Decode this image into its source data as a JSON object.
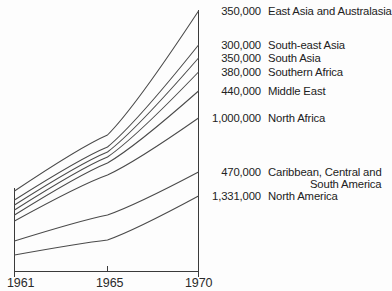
{
  "chart_data": {
    "type": "line",
    "title": "",
    "xlabel": "",
    "ylabel": "",
    "x": [
      "1961",
      "1965",
      "1970"
    ],
    "xtick_labels": [
      "1961",
      "1965",
      "1970"
    ],
    "grid": false,
    "legend_position": "right-of-axis",
    "note": "Cumulative band line chart; each line is labelled at its 1970 endpoint with a value and region name.",
    "series": [
      {
        "name": "East Asia and Australasia",
        "value_label": "350,000",
        "value": 350000,
        "points": [
          {
            "x": "1961",
            "y": 191
          },
          {
            "x": "1965",
            "y": 135
          },
          {
            "x": "1970",
            "y": 11
          }
        ]
      },
      {
        "name": "South-east Asia",
        "value_label": "300,000",
        "value": 300000,
        "points": [
          {
            "x": "1961",
            "y": 200
          },
          {
            "x": "1965",
            "y": 147
          },
          {
            "x": "1970",
            "y": 45
          }
        ]
      },
      {
        "name": "South Asia",
        "value_label": "350,000",
        "value": 350000,
        "points": [
          {
            "x": "1961",
            "y": 205
          },
          {
            "x": "1965",
            "y": 152
          },
          {
            "x": "1970",
            "y": 58
          }
        ]
      },
      {
        "name": "Southern Africa",
        "value_label": "380,000",
        "value": 380000,
        "points": [
          {
            "x": "1961",
            "y": 210
          },
          {
            "x": "1965",
            "y": 157
          },
          {
            "x": "1970",
            "y": 72
          }
        ]
      },
      {
        "name": "Middle East",
        "value_label": "440,000",
        "value": 440000,
        "points": [
          {
            "x": "1961",
            "y": 215
          },
          {
            "x": "1965",
            "y": 163
          },
          {
            "x": "1970",
            "y": 91
          }
        ]
      },
      {
        "name": "North Africa",
        "value_label": "1,000,000",
        "value": 1000000,
        "points": [
          {
            "x": "1961",
            "y": 221
          },
          {
            "x": "1965",
            "y": 175
          },
          {
            "x": "1970",
            "y": 118
          }
        ]
      },
      {
        "name": "Caribbean, Central and South America",
        "name_line1": "Caribbean, Central and",
        "name_line2": "South America",
        "value_label": "470,000",
        "value": 470000,
        "points": [
          {
            "x": "1961",
            "y": 241
          },
          {
            "x": "1965",
            "y": 215
          },
          {
            "x": "1970",
            "y": 172
          }
        ]
      },
      {
        "name": "North America",
        "value_label": "1,331,000",
        "value": 1331000,
        "points": [
          {
            "x": "1961",
            "y": 255
          },
          {
            "x": "1965",
            "y": 240
          },
          {
            "x": "1970",
            "y": 196
          }
        ]
      }
    ]
  },
  "axis": {
    "x_labels": [
      {
        "text": "1961"
      },
      {
        "text": "1965"
      },
      {
        "text": "1970"
      }
    ]
  },
  "legend": [
    {
      "value": "350,000",
      "label": "East Asia and Australasia"
    },
    {
      "value": "300,000",
      "label": "South-east Asia"
    },
    {
      "value": "350,000",
      "label": "South Asia"
    },
    {
      "value": "380,000",
      "label": "Southern Africa"
    },
    {
      "value": "440,000",
      "label": "Middle East"
    },
    {
      "value": "1,000,000",
      "label": "North Africa"
    },
    {
      "value": "470,000",
      "label": "Caribbean, Central and",
      "label2": "South America"
    },
    {
      "value": "1,331,000",
      "label": "North America"
    }
  ]
}
